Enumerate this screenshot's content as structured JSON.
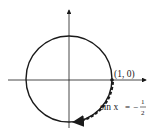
{
  "diagram": {
    "type": "unit-circle",
    "point_label": "(1, 0)",
    "equation": {
      "lhs": "sin x",
      "equals": "=",
      "sign": "−",
      "numerator": "1",
      "denominator": "2"
    },
    "colors": {
      "stroke": "#1a1a1a",
      "background": "#ffffff"
    }
  }
}
